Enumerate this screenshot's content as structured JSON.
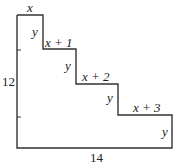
{
  "diagram": {
    "type": "staircase-polygon",
    "labels": {
      "top_width": "x",
      "step_heights": [
        "y",
        "y",
        "y",
        "y"
      ],
      "step_widths": [
        "x",
        "x + 1",
        "x + 2",
        "x + 3"
      ],
      "left_height": "12",
      "bottom_width": "14"
    }
  },
  "text": {
    "x": "x",
    "y1": "y",
    "x1": "x + 1",
    "y2": "y",
    "x2": "x + 2",
    "y3": "y",
    "x3": "x + 3",
    "y4": "y",
    "left": "12",
    "bottom": "14"
  },
  "colors": {
    "stroke": "#333333",
    "background": "#ffffff"
  }
}
